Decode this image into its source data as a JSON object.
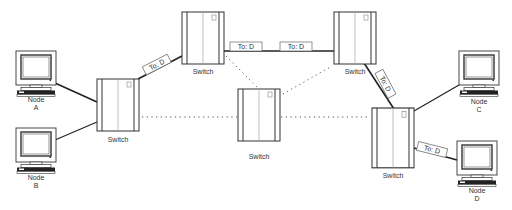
{
  "diagram": {
    "switch_label": "Switch",
    "tag_label": "To: D",
    "nodes": [
      {
        "id": "A",
        "line1": "Node",
        "line2": "A"
      },
      {
        "id": "B",
        "line1": "Node",
        "line2": "B"
      },
      {
        "id": "C",
        "line1": "Node",
        "line2": "C"
      },
      {
        "id": "D",
        "line1": "Node",
        "line2": "D"
      }
    ],
    "switches": [
      {
        "id": "left",
        "label": "Switch"
      },
      {
        "id": "top-left",
        "label": "Switch"
      },
      {
        "id": "center",
        "label": "Switch"
      },
      {
        "id": "top-right",
        "label": "Switch"
      },
      {
        "id": "bottom-right",
        "label": "Switch"
      }
    ],
    "tags": [
      {
        "label": "To: D"
      },
      {
        "label": "To: D"
      },
      {
        "label": "To: D"
      },
      {
        "label": "To: D"
      },
      {
        "label": "To: D"
      }
    ],
    "colors": {
      "line": "#222222",
      "outline": "#333333",
      "dotted": "#555555"
    }
  }
}
